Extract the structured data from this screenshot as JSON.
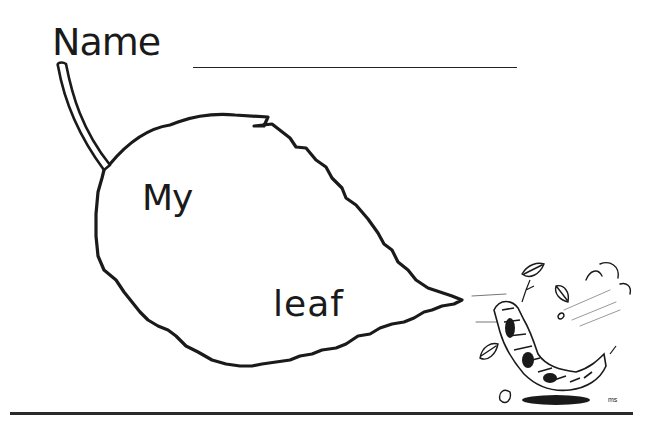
{
  "worksheet": {
    "name_label": "Name",
    "leaf_text_line1": "My",
    "leaf_text_line2": "leaf",
    "illustration": "caterpillar-with-falling-leaves",
    "colors": {
      "ink": "#1a1a1a",
      "paper": "#ffffff"
    }
  }
}
